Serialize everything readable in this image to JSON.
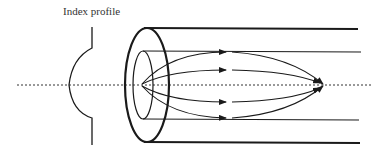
{
  "diagram": {
    "labels": {
      "index_profile": "Index profile"
    },
    "elements": {
      "optical_axis": "dotted-line",
      "index_profile_curve": "parabolic-profile",
      "cladding": "outer-cylinder",
      "core": "inner-cylinder",
      "rays": [
        "outer-upper-ray",
        "inner-upper-ray",
        "inner-lower-ray",
        "outer-lower-ray"
      ]
    },
    "colors": {
      "stroke": "#1a1a1a",
      "text": "#333333",
      "background": "#ffffff"
    }
  }
}
